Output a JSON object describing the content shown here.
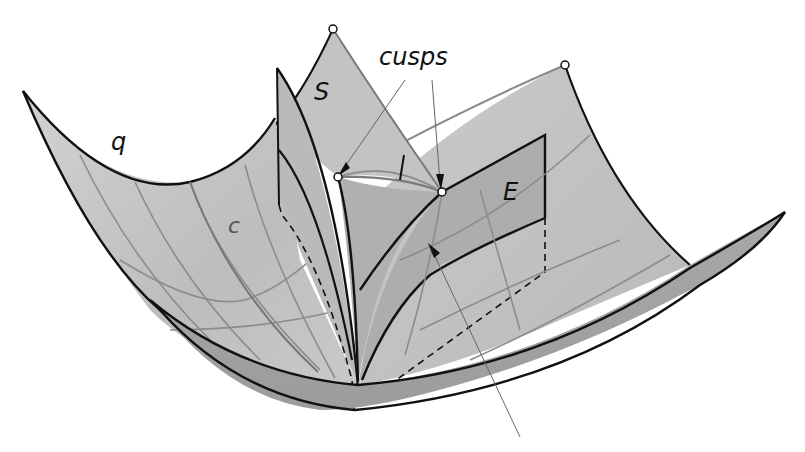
{
  "figure": {
    "type": "3d-surface-diagram",
    "labels": {
      "q": "q",
      "c": "c",
      "S": "S",
      "E": "E",
      "cusps": "cusps"
    },
    "annotations": [
      {
        "id": "cusp-left",
        "label": "cusps",
        "x": 338,
        "y": 177
      },
      {
        "id": "cusp-right",
        "label": "cusps",
        "x": 442,
        "y": 192
      }
    ],
    "marked_points": [
      {
        "id": "S-apex",
        "x": 333,
        "y": 29
      },
      {
        "id": "E-apex",
        "x": 565,
        "y": 65
      },
      {
        "id": "cusp-left",
        "x": 338,
        "y": 177
      },
      {
        "id": "cusp-right",
        "x": 442,
        "y": 192
      }
    ],
    "colors": {
      "surface_light": "#c8c8c8",
      "surface_mid": "#b4b4b4",
      "surface_dark": "#9a9a9a",
      "edge": "#111111",
      "grid": "#808080",
      "background": "#ffffff"
    }
  }
}
